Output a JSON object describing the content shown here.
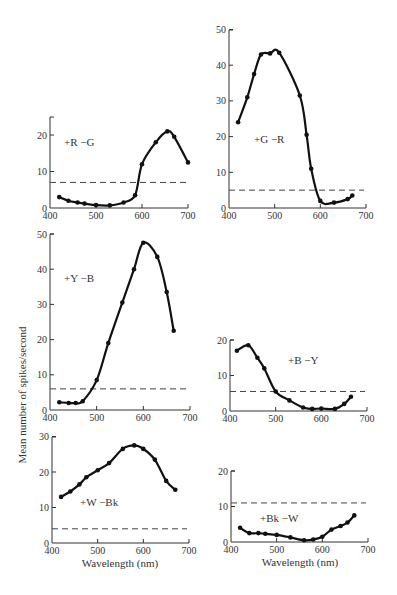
{
  "figure": {
    "ylabel": "Mean number of spikes/second",
    "xlabel": "Wavelength (nm)"
  },
  "chart_data": [
    {
      "type": "line",
      "id": "rg",
      "label": "+R  −G",
      "xlabel": "",
      "ylabel": "",
      "xlim": [
        400,
        700
      ],
      "ylim": [
        0,
        25
      ],
      "xticks": [
        400,
        500,
        600,
        700
      ],
      "yticks": [
        0,
        10,
        20
      ],
      "grid": false,
      "baseline": 7,
      "x": [
        420,
        440,
        460,
        475,
        500,
        530,
        560,
        585,
        600,
        630,
        655,
        670,
        700
      ],
      "y": [
        3,
        2,
        1.5,
        1.2,
        0.8,
        0.7,
        1.5,
        3.5,
        12,
        18,
        21,
        19.5,
        12.5
      ],
      "frame": {
        "x0": 50,
        "x1": 188,
        "y0": 208,
        "ppu": 3.65,
        "top": 117,
        "label_x": 64,
        "label_y": 146
      }
    },
    {
      "type": "line",
      "id": "gr",
      "label": "+G  −R",
      "xlabel": "",
      "ylabel": "",
      "xlim": [
        400,
        700
      ],
      "ylim": [
        0,
        50
      ],
      "xticks": [
        400,
        500,
        600,
        700
      ],
      "yticks": [
        0,
        10,
        20,
        30,
        40,
        50
      ],
      "grid": false,
      "baseline": 5,
      "x": [
        420,
        440,
        455,
        470,
        490,
        510,
        555,
        570,
        580,
        600,
        630,
        660,
        670
      ],
      "y": [
        24,
        31,
        37.5,
        43,
        43.3,
        43.5,
        31.5,
        20.5,
        11,
        2,
        1.5,
        2.5,
        3.5
      ],
      "frame": {
        "x0": 229,
        "x1": 366,
        "y0": 208,
        "ppu": 3.57,
        "top": 30,
        "label_x": 254,
        "label_y": 143
      }
    },
    {
      "type": "line",
      "id": "yb",
      "label": "+Y  −B",
      "xlabel": "",
      "ylabel": "",
      "xlim": [
        400,
        700
      ],
      "ylim": [
        0,
        50
      ],
      "xticks": [
        400,
        500,
        600,
        700
      ],
      "yticks": [
        0,
        10,
        20,
        30,
        40,
        50
      ],
      "grid": false,
      "baseline": 6,
      "x": [
        420,
        440,
        455,
        470,
        500,
        525,
        555,
        580,
        600,
        630,
        650,
        665
      ],
      "y": [
        2.2,
        2,
        2,
        2.5,
        8.5,
        19,
        30.5,
        40,
        47.5,
        43.5,
        33.5,
        22.5
      ],
      "frame": {
        "x0": 50,
        "x1": 190,
        "y0": 410,
        "ppu": 3.52,
        "top": 234,
        "label_x": 64,
        "label_y": 282
      }
    },
    {
      "type": "line",
      "id": "by",
      "label": "+B  −Y",
      "xlabel": "",
      "ylabel": "",
      "xlim": [
        400,
        700
      ],
      "ylim": [
        0,
        20
      ],
      "xticks": [
        400,
        500,
        600,
        700
      ],
      "yticks": [
        0,
        10,
        20
      ],
      "grid": false,
      "baseline": 5.5,
      "x": [
        415,
        440,
        460,
        475,
        500,
        530,
        560,
        580,
        600,
        630,
        650,
        665
      ],
      "y": [
        17,
        18.5,
        15,
        12,
        5.5,
        3,
        1,
        0.6,
        0.7,
        0.6,
        2,
        4
      ],
      "frame": {
        "x0": 230,
        "x1": 367,
        "y0": 411,
        "ppu": 3.55,
        "top": 340,
        "label_x": 288,
        "label_y": 364
      }
    },
    {
      "type": "line",
      "id": "wbk",
      "label": "+W  −Bk",
      "xlabel": "Wavelength (nm)",
      "ylabel": "",
      "xlim": [
        400,
        700
      ],
      "ylim": [
        0,
        30
      ],
      "xticks": [
        400,
        500,
        600,
        700
      ],
      "yticks": [
        0,
        10,
        20,
        30
      ],
      "grid": false,
      "baseline": 4,
      "x": [
        420,
        440,
        460,
        475,
        500,
        525,
        555,
        580,
        600,
        625,
        650,
        670
      ],
      "y": [
        13,
        14.5,
        16.5,
        18.5,
        20.5,
        22.5,
        26.5,
        27.5,
        26.5,
        23.5,
        17.5,
        15
      ],
      "frame": {
        "x0": 52,
        "x1": 189,
        "y0": 543,
        "ppu": 3.55,
        "top": 437,
        "label_x": 80,
        "label_y": 506
      }
    },
    {
      "type": "line",
      "id": "bkw",
      "label": "+Bk  −W",
      "xlabel": "Wavelength (nm)",
      "ylabel": "",
      "xlim": [
        400,
        700
      ],
      "ylim": [
        0,
        20
      ],
      "xticks": [
        400,
        500,
        600,
        700
      ],
      "yticks": [
        0,
        10,
        20
      ],
      "grid": false,
      "baseline": 11,
      "x": [
        420,
        440,
        460,
        475,
        500,
        530,
        560,
        580,
        600,
        620,
        640,
        655,
        670
      ],
      "y": [
        4,
        2.5,
        2.5,
        2.3,
        2,
        1.3,
        0.5,
        0.7,
        1.5,
        3.5,
        4.5,
        5.5,
        7.5
      ],
      "frame": {
        "x0": 231,
        "x1": 368,
        "y0": 542,
        "ppu": 3.55,
        "top": 471,
        "label_x": 260,
        "label_y": 522
      }
    }
  ]
}
